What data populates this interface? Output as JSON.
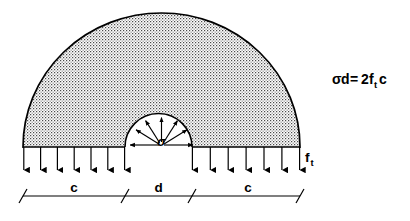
{
  "figure": {
    "equation": {
      "lhs_sigma": "σ",
      "lhs_d": "d",
      "equals": "=",
      "coefficient": "2",
      "f_symbol": "f",
      "f_subscript": "t",
      "rhs_c": "c",
      "full_text": "σd=2fₜc"
    },
    "labels": {
      "inner_pressure": "σ",
      "edge_stress_symbol": "f",
      "edge_stress_subscript": "t",
      "edge_stress_full": "fₜ"
    },
    "dimensions": [
      {
        "name": "left-cover",
        "label": "c"
      },
      {
        "name": "bar-diameter",
        "label": "d"
      },
      {
        "name": "right-cover",
        "label": "c"
      }
    ],
    "geometry": {
      "dome_left_x": 23,
      "dome_right_x": 300,
      "dome_top_y": 13,
      "baseline_y": 147,
      "center_x": 161.5,
      "inner_left_x": 125,
      "inner_right_x": 192,
      "inner_radius": 33.5,
      "dim_line_y": 196,
      "down_arrow_tip_y": 172,
      "left_arrow_count": 7,
      "right_arrow_count": 7,
      "radial_ray_count": 7
    },
    "colors": {
      "stroke": "#000000",
      "background": "#ffffff",
      "stipple_dot": "#555555",
      "fill_tone": "#efefef"
    }
  }
}
